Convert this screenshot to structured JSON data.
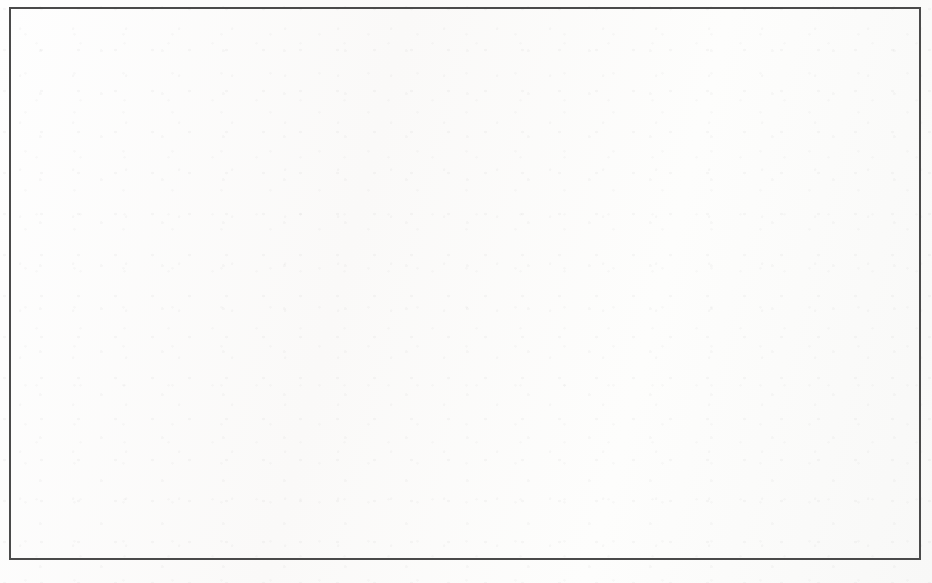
{
  "chart_data": {
    "type": "area",
    "stacked": true,
    "title": "",
    "subtitle": "",
    "xlabel": "",
    "ylabel": "",
    "categories": [
      "1999",
      "2000",
      "2001",
      "2002"
    ],
    "x_tick_labels": [
      "1999",
      "2000",
      "2001",
      "2002"
    ],
    "y_tick_labels": [
      "$0",
      "$500,000,000",
      "$1,000,000,000",
      "$1,500,000,000",
      "$2,000,000,000",
      "$2,500,000,000",
      "$3,000,000,000",
      "$3,500,000,000"
    ],
    "y_tick_values": [
      0,
      500000000,
      1000000000,
      1500000000,
      2000000000,
      2500000000,
      3000000000,
      3500000000
    ],
    "ylim": [
      0,
      3500000000
    ],
    "grid": "horizontal",
    "legend": "none",
    "series": [
      {
        "name": "lower-band",
        "color": "#e7e7e7",
        "values": [
          2000000000,
          2530000000,
          2230000000,
          1870000000
        ]
      },
      {
        "name": "upper-band",
        "color": "#6b6b6b",
        "values": [
          0,
          450000000,
          600000000,
          610000000
        ]
      }
    ],
    "cumulative_top": [
      2000000000,
      2980000000,
      2830000000,
      2480000000
    ],
    "annotations": []
  },
  "figure": {
    "background_color": "#fdfdfc",
    "border_color": "#4a4a4a",
    "plot_area": {
      "left": 152,
      "top": 33,
      "right": 880,
      "bottom": 518
    }
  },
  "ghost_marks": [
    {
      "text": "",
      "left": 690,
      "top": 148
    },
    {
      "text": "",
      "left": 150,
      "top": 330
    }
  ]
}
